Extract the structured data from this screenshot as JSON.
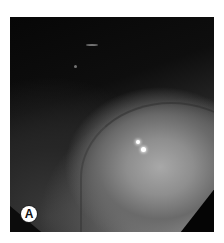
{
  "figure": {
    "panel_label": "A",
    "colors": {
      "background": "#0a0a0a",
      "tissue_highlight": "#a8a8a8",
      "label_bg": "#ffffff",
      "label_text": "#111111"
    }
  }
}
